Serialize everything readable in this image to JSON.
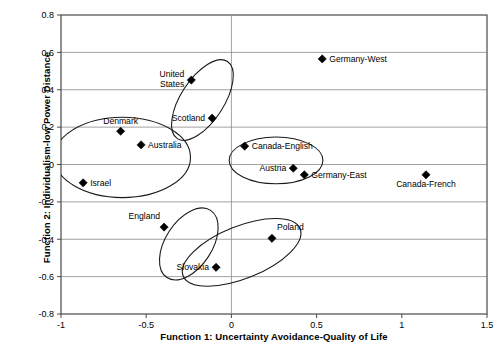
{
  "chart_data": {
    "type": "scatter",
    "title": "",
    "xlabel": "Function 1: Uncertainty Avoidance-Quality of Life",
    "ylabel": "Function 2: Individualism-low Power Distance",
    "xlim": [
      -1,
      1.5
    ],
    "ylim": [
      -0.8,
      0.8
    ],
    "xticks": [
      "-1",
      "-0.5",
      "0",
      "0.5",
      "1",
      "1.5"
    ],
    "xtick_values": [
      -1,
      -0.5,
      0,
      0.5,
      1,
      1.5
    ],
    "yticks": [
      "0.8",
      "0.6",
      "0.4",
      "0.2",
      "0",
      "-0.2",
      "-0.4",
      "-0.6",
      "-0.8"
    ],
    "ytick_values": [
      0.8,
      0.6,
      0.4,
      0.2,
      0,
      -0.2,
      -0.4,
      -0.6,
      -0.8
    ],
    "grid": "horizontal",
    "legend": "none",
    "marker": "diamond",
    "marker_color": "#000000",
    "points": [
      {
        "label": "United States",
        "x": -0.235,
        "y": 0.452,
        "label_pos": "left-two-line"
      },
      {
        "label": "Scotland",
        "x": -0.113,
        "y": 0.248,
        "label_pos": "left"
      },
      {
        "label": "Germany-West",
        "x": 0.533,
        "y": 0.565,
        "label_pos": "right"
      },
      {
        "label": "Denmark",
        "x": -0.65,
        "y": 0.178,
        "label_pos": "above"
      },
      {
        "label": "Australia",
        "x": -0.53,
        "y": 0.105,
        "label_pos": "right"
      },
      {
        "label": "Canada-English",
        "x": 0.078,
        "y": 0.098,
        "label_pos": "right"
      },
      {
        "label": "Austria",
        "x": 0.363,
        "y": -0.02,
        "label_pos": "left"
      },
      {
        "label": "Germany-East",
        "x": 0.428,
        "y": -0.055,
        "label_pos": "right"
      },
      {
        "label": "Canada-French",
        "x": 1.142,
        "y": -0.055,
        "label_pos": "below"
      },
      {
        "label": "Israel",
        "x": -0.87,
        "y": -0.098,
        "label_pos": "right"
      },
      {
        "label": "England",
        "x": -0.395,
        "y": -0.335,
        "label_pos": "above-left"
      },
      {
        "label": "Poland",
        "x": 0.238,
        "y": -0.395,
        "label_pos": "above-right"
      },
      {
        "label": "Slovakia",
        "x": -0.09,
        "y": -0.55,
        "label_pos": "left"
      }
    ],
    "clusters": [
      {
        "name": "denmark-australia-israel-cluster",
        "cx": -0.64,
        "cy": 0.038,
        "rx": 0.4,
        "ry": 0.215,
        "rotation": 0
      },
      {
        "name": "us-scotland-cluster",
        "cx": -0.17,
        "cy": 0.345,
        "rx": 0.27,
        "ry": 0.115,
        "rotation": -57
      },
      {
        "name": "canada-austria-germany-cluster",
        "cx": 0.262,
        "cy": 0.022,
        "rx": 0.275,
        "ry": 0.125,
        "rotation": 0
      },
      {
        "name": "england-slovakia-cluster",
        "cx": -0.25,
        "cy": -0.425,
        "rx": 0.235,
        "ry": 0.125,
        "rotation": -57
      },
      {
        "name": "slovakia-poland-cluster",
        "cx": 0.06,
        "cy": -0.47,
        "rx": 0.37,
        "ry": 0.14,
        "rotation": -22
      }
    ]
  },
  "axis": {
    "xlabel": "Function 1: Uncertainty Avoidance-Quality of Life",
    "ylabel": "Function 2: Individualism-low Power Distance"
  }
}
